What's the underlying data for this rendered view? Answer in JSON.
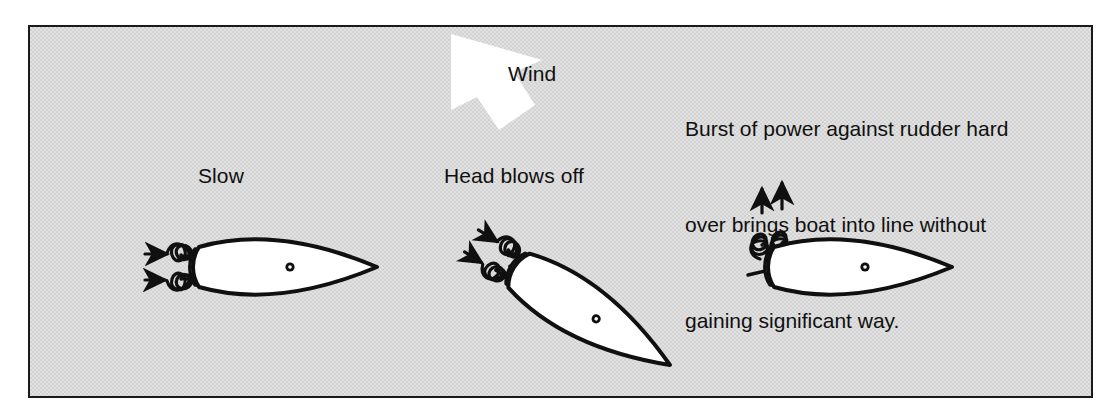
{
  "figure": {
    "name": "boat-handling-wind-diagram",
    "background_color": "#d9d9d9",
    "border_color": "#1a1a1a",
    "ink_color": "#101010",
    "hull_fill": "#ffffff",
    "arrow_fill": "#ffffff"
  },
  "wind": {
    "label": "Wind",
    "direction": "down-right",
    "arrow_name": "wind-block-arrow"
  },
  "caption": {
    "lines": [
      "Burst of power against rudder hard",
      "over brings boat into line without",
      "gaining significant way."
    ],
    "line1": "Burst of power against rudder hard",
    "line2": "over brings boat into line without",
    "line3": "gaining significant way."
  },
  "panels": [
    {
      "id": "stage-1",
      "label": "Slow",
      "heading_deg": 0,
      "description": "Boat moving slowly, head to line, prop wash streaming aft to port",
      "wash_direction": "aft-left",
      "wash_arrows": 2
    },
    {
      "id": "stage-2",
      "label": "Head blows off",
      "heading_deg": 32,
      "description": "Bow falls off to leeward as wind catches the head",
      "wash_direction": "aft-left",
      "wash_arrows": 2
    },
    {
      "id": "stage-3",
      "label": "",
      "heading_deg": 0,
      "description": "Burst of power with rudder hard over swings the boat back into line",
      "wash_direction": "up-sideways",
      "wash_arrows": 2
    }
  ],
  "legend": {
    "mast_marker": "mast-dot",
    "wash_marker": "prop-wash-spiral-arrow"
  }
}
